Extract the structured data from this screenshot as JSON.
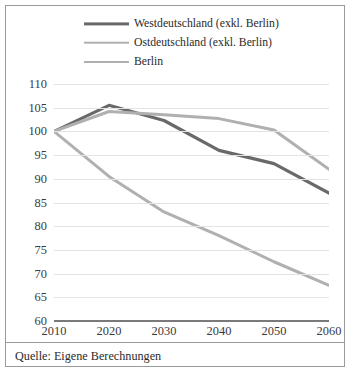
{
  "legend": {
    "items": [
      {
        "label": "Westdeutschland (exkl. Berlin)",
        "key": "west",
        "color": "#696969",
        "style": "solid"
      },
      {
        "label": "Ostdeutschland (exkl. Berlin)",
        "key": "ost",
        "color": "#b0b0b0",
        "style": "solid"
      },
      {
        "label": "Berlin",
        "key": "berlin",
        "color": "#b0b0b0",
        "style": "dashed"
      }
    ]
  },
  "source": {
    "text": "Quelle: Eigene Berechnungen"
  },
  "chart_data": {
    "type": "line",
    "title": "",
    "subtitle": "",
    "xlabel": "",
    "ylabel": "",
    "categories": [
      2010,
      2020,
      2030,
      2040,
      2050,
      2060
    ],
    "x": [
      2010,
      2020,
      2030,
      2040,
      2050,
      2060
    ],
    "xlim": [
      2010,
      2060
    ],
    "ylim": [
      60,
      110
    ],
    "yticks": [
      60,
      65,
      70,
      75,
      80,
      85,
      90,
      95,
      100,
      105,
      110
    ],
    "xticks": [
      2010,
      2020,
      2030,
      2040,
      2050,
      2060
    ],
    "grid": true,
    "legend_position": "top",
    "series": [
      {
        "name": "Westdeutschland (exkl. Berlin)",
        "color": "#696969",
        "style": "solid",
        "width": 3.2,
        "values": [
          100,
          105.5,
          102.3,
          96.0,
          93.2,
          87.0
        ]
      },
      {
        "name": "Ostdeutschland (exkl. Berlin)",
        "color": "#b0b0b0",
        "style": "solid",
        "width": 3.0,
        "values": [
          100,
          90.5,
          83.0,
          78.0,
          72.5,
          67.5
        ]
      },
      {
        "name": "Berlin",
        "color": "#b0b0b0",
        "style": "dashed",
        "width": 3.0,
        "values": [
          100,
          104.2,
          103.5,
          102.7,
          100.3,
          92.0
        ]
      }
    ]
  }
}
